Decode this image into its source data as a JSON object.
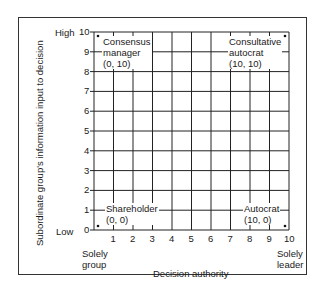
{
  "diagram": {
    "y_axis": {
      "title": "Subordinate group's information input to decision",
      "high_label": "High",
      "low_label": "Low",
      "ticks": [
        "0",
        "1",
        "2",
        "3",
        "4",
        "5",
        "6",
        "7",
        "8",
        "9",
        "10"
      ]
    },
    "x_axis": {
      "title": "Decision authority",
      "left_label_line1": "Solely",
      "left_label_line2": "group",
      "right_label_line1": "Solely",
      "right_label_line2": "leader",
      "ticks": [
        "1",
        "2",
        "3",
        "4",
        "5",
        "6",
        "7",
        "8",
        "9",
        "10"
      ]
    },
    "corners": {
      "top_left": {
        "line1": "Consensus",
        "line2": "manager",
        "line3": "(0, 10)"
      },
      "top_right": {
        "line1": "Consultative",
        "line2": "autocrat",
        "line3": "(10, 10)"
      },
      "bottom_left": {
        "line1": "Shareholder",
        "line2": "(0, 0)"
      },
      "bottom_right": {
        "line1": "Autocrat",
        "line2": "(10, 0)"
      }
    }
  }
}
